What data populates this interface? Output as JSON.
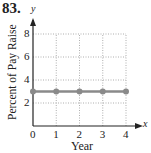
{
  "problem_number": "83.",
  "chart_data": {
    "type": "line",
    "title": "",
    "xlabel": "Year",
    "ylabel": "Percent of Pay Raise",
    "x_axis_name": "x",
    "y_axis_name": "y",
    "x": [
      0,
      1,
      2,
      3,
      4
    ],
    "series": [
      {
        "name": "Percent of Pay Raise",
        "values": [
          3,
          3,
          3,
          3,
          3
        ]
      }
    ],
    "xticks": [
      "0",
      "1",
      "2",
      "3",
      "4"
    ],
    "yticks": [
      "2",
      "4",
      "6",
      "8"
    ],
    "xlim": [
      0,
      4
    ],
    "ylim": [
      0,
      8
    ],
    "grid": true,
    "legend": "none"
  },
  "colors": {
    "line": "#8a8a8a",
    "axis": "#222222",
    "grid": "#9a9a9a"
  }
}
